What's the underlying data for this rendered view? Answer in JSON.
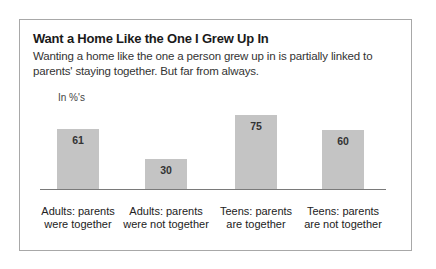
{
  "figure": {
    "title": "Want a Home Like the One I Grew Up In",
    "subtitle": "Wanting a home like the one a person grew up in is partially linked to parents' staying together. But far from always.",
    "unit_label": "In %'s",
    "bar_color": "#c4c4c4",
    "border_color": "#a8a8a8"
  },
  "bars": [
    {
      "label_line1": "Adults: parents",
      "label_line2": "were together",
      "value": "61"
    },
    {
      "label_line1": "Adults: parents",
      "label_line2": "were not together",
      "value": "30"
    },
    {
      "label_line1": "Teens: parents",
      "label_line2": "are together",
      "value": "75"
    },
    {
      "label_line1": "Teens: parents",
      "label_line2": "are not together",
      "value": "60"
    }
  ],
  "chart_data": {
    "type": "bar",
    "title": "Want a Home Like the One I Grew Up In",
    "subtitle": "Wanting a home like the one a person grew up in is partially linked to parents' staying together. But far from always.",
    "categories": [
      "Adults: parents were together",
      "Adults: parents were not together",
      "Teens: parents are together",
      "Teens: parents are not together"
    ],
    "values": [
      61,
      30,
      75,
      60
    ],
    "xlabel": "",
    "ylabel": "In %'s",
    "ylim": [
      0,
      100
    ],
    "grid": false,
    "legend": null,
    "data_labels": true
  }
}
